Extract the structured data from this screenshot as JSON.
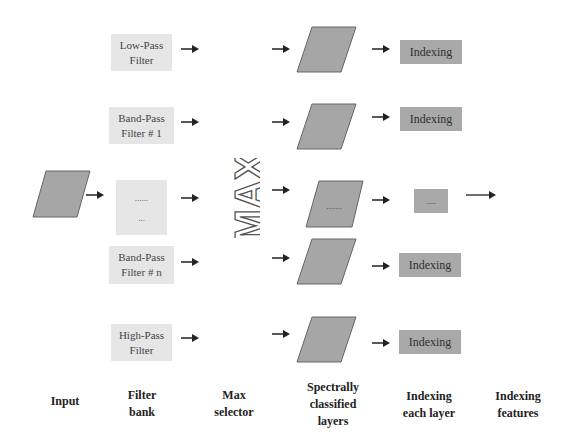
{
  "diagram": {
    "input": {
      "label": "Input"
    },
    "filters": [
      {
        "line1": "Low-Pass",
        "line2": "Filter"
      },
      {
        "line1": "Band-Pass",
        "line2": "Filter # 1"
      },
      {
        "line1": "......",
        "line2": "..."
      },
      {
        "line1": "Band-Pass",
        "line2": "Filter # n"
      },
      {
        "line1": "High-Pass",
        "line2": "Filter"
      }
    ],
    "max_selector": {
      "text": "MAX"
    },
    "layers": [
      {
        "text": ""
      },
      {
        "text": ""
      },
      {
        "text": "......."
      },
      {
        "text": ""
      },
      {
        "text": ""
      }
    ],
    "indexing": [
      {
        "text": "Indexing"
      },
      {
        "text": "Indexing"
      },
      {
        "text": "....."
      },
      {
        "text": "Indexing"
      },
      {
        "text": "Indexing"
      }
    ],
    "column_labels": [
      {
        "line1": "Input",
        "line2": ""
      },
      {
        "line1": "Filter",
        "line2": "bank"
      },
      {
        "line1": "Max",
        "line2": "selector"
      },
      {
        "line1": "Spectrally",
        "line2": "classified",
        "line3": "layers"
      },
      {
        "line1": "Indexing",
        "line2": "each layer"
      },
      {
        "line1": "Indexing",
        "line2": "features"
      }
    ],
    "colors": {
      "filter_fill": "#e6e6e6",
      "layer_fill": "#a6a6a6",
      "index_fill": "#a9a9a9",
      "arrow": "#222222"
    }
  }
}
